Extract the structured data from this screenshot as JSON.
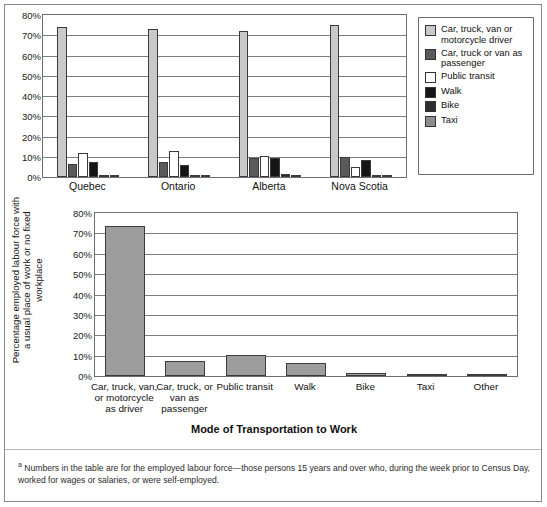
{
  "figure": {
    "footnote_marker": "a",
    "footnote_text": "Numbers in the table are for the employed labour force—those persons 15 years and over who, during the week prior to Census Day, worked for wages or salaries, or were self-employed."
  },
  "legend": {
    "items": [
      {
        "label": "Car, truck, van or motorcycle driver",
        "color": "#c9c9c9"
      },
      {
        "label": "Car, truck or van as passenger",
        "color": "#5a5a5a"
      },
      {
        "label": "Public transit",
        "color": "#ffffff"
      },
      {
        "label": "Walk",
        "color": "#151515"
      },
      {
        "label": "Bike",
        "color": "#2e2e2e"
      },
      {
        "label": "Taxi",
        "color": "#8d8d8d"
      }
    ]
  },
  "chart_data": [
    {
      "type": "bar",
      "id": "provinces-by-mode",
      "title": "",
      "xlabel": "",
      "ylabel": "",
      "ylim": [
        0,
        80
      ],
      "yticks": [
        "0%",
        "10%",
        "20%",
        "30%",
        "40%",
        "50%",
        "60%",
        "70%",
        "80%"
      ],
      "ytick_values": [
        0,
        10,
        20,
        30,
        40,
        50,
        60,
        70,
        80
      ],
      "grid": true,
      "legend_position": "right",
      "categories": [
        "Quebec",
        "Ontario",
        "Alberta",
        "Nova Scotia"
      ],
      "series": [
        {
          "name": "Car, truck, van or motorcycle driver",
          "color": "#c9c9c9",
          "values": [
            74.0,
            73.0,
            72.0,
            75.0
          ]
        },
        {
          "name": "Car, truck or van as passenger",
          "color": "#5a5a5a",
          "values": [
            6.2,
            7.3,
            9.2,
            10.1
          ]
        },
        {
          "name": "Public transit",
          "color": "#ffffff",
          "values": [
            12.0,
            12.8,
            10.2,
            5.0
          ]
        },
        {
          "name": "Walk",
          "color": "#151515",
          "values": [
            7.4,
            6.1,
            9.2,
            8.6
          ]
        },
        {
          "name": "Bike",
          "color": "#2e2e2e",
          "values": [
            1.0,
            0.7,
            1.3,
            0.8
          ]
        },
        {
          "name": "Taxi",
          "color": "#8d8d8d",
          "values": [
            0.3,
            0.3,
            0.7,
            0.4
          ]
        }
      ]
    },
    {
      "type": "bar",
      "id": "canada-by-mode",
      "title": "",
      "xlabel": "Mode of Transportation to Work",
      "ylabel": "Percentage employed labour force with a usual place of work or no fixed workplace",
      "ylim": [
        0,
        80
      ],
      "yticks": [
        "0%",
        "10%",
        "20%",
        "30%",
        "40%",
        "50%",
        "60%",
        "70%",
        "80%"
      ],
      "ytick_values": [
        0,
        10,
        20,
        30,
        40,
        50,
        60,
        70,
        80
      ],
      "grid": true,
      "bar_color": "#9d9d9d",
      "categories": [
        "Car, truck, van, or motorcycle as driver",
        "Car, truck, or van as passenger",
        "Public transit",
        "Walk",
        "Bike",
        "Taxi",
        "Other"
      ],
      "values": [
        73.5,
        7.2,
        10.4,
        6.5,
        1.3,
        0.2,
        0.6
      ]
    }
  ]
}
